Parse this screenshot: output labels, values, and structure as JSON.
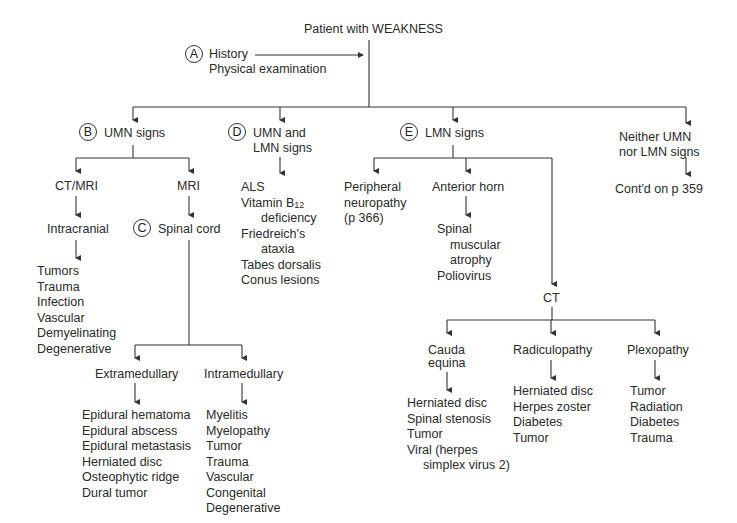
{
  "title": "Patient with WEAKNESS",
  "step_a": {
    "badge": "A",
    "lines": [
      "History",
      "Physical examination"
    ]
  },
  "branches": {
    "umn": {
      "badge": "B",
      "label": "UMN signs",
      "ct_mri": {
        "label": "CT/MRI",
        "child": "Intracranial",
        "causes": [
          "Tumors",
          "Trauma",
          "Infection",
          "Vascular",
          "Demyelinating",
          "Degenerative"
        ]
      },
      "mri": {
        "label": "MRI",
        "badge": "C",
        "child": "Spinal cord",
        "extramedullary": {
          "label": "Extramedullary",
          "causes": [
            "Epidural hematoma",
            "Epidural abscess",
            "Epidural metastasis",
            "Herniated disc",
            "Osteophytic ridge",
            "Dural tumor"
          ]
        },
        "intramedullary": {
          "label": "Intramedullary",
          "causes": [
            "Myelitis",
            "Myelopathy",
            "Tumor",
            "Trauma",
            "Vascular",
            "Congenital",
            "Degenerative"
          ]
        }
      }
    },
    "umn_lmn": {
      "badge": "D",
      "label_line1": "UMN and",
      "label_line2": "LMN signs",
      "causes": {
        "als": "ALS",
        "vitb12_a": "Vitamin B",
        "vitb12_sub": "12",
        "vitb12_b": "deficiency",
        "friedreich_a": "Friedreich's",
        "friedreich_b": "ataxia",
        "tabes": "Tabes dorsalis",
        "conus": "Conus lesions"
      }
    },
    "lmn": {
      "badge": "E",
      "label": "LMN signs",
      "peripheral": {
        "lines": [
          "Peripheral",
          "neuropathy",
          "(p 366)"
        ]
      },
      "anterior_horn": {
        "label": "Anterior horn",
        "causes_a": "Spinal",
        "causes_b": "muscular",
        "causes_c": "atrophy",
        "causes_d": "Poliovirus"
      },
      "ct": {
        "label": "CT",
        "cauda_equina": {
          "label_line1": "Cauda",
          "label_line2": "equina",
          "causes": [
            "Herniated disc",
            "Spinal stenosis",
            "Tumor",
            "Viral (herpes"
          ],
          "cause_cont": "simplex virus 2)"
        },
        "radiculopathy": {
          "label": "Radiculopathy",
          "causes": [
            "Herniated disc",
            "Herpes zoster",
            "Diabetes",
            "Tumor"
          ]
        },
        "plexopathy": {
          "label": "Plexopathy",
          "causes": [
            "Tumor",
            "Radiation",
            "Diabetes",
            "Trauma"
          ]
        }
      }
    },
    "neither": {
      "label_line1": "Neither UMN",
      "label_line2": "nor LMN signs",
      "continued": "Cont'd on p 359"
    }
  }
}
